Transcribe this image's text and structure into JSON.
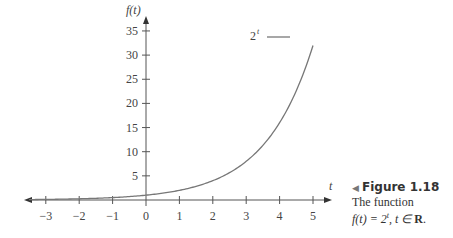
{
  "chart_data": {
    "type": "line",
    "title": "",
    "xlabel": "t",
    "ylabel": "f(t)",
    "xlim": [
      -3.5,
      5.7
    ],
    "ylim": [
      0,
      37
    ],
    "x_ticks": [
      -3,
      -2,
      -1,
      0,
      1,
      2,
      3,
      4,
      5
    ],
    "y_ticks": [
      5,
      10,
      15,
      20,
      25,
      30,
      35
    ],
    "grid": false,
    "legend_position": "top-center",
    "series": [
      {
        "name": "2^t",
        "x": [
          -3.5,
          -3,
          -2,
          -1,
          0,
          1,
          2,
          3,
          4,
          5
        ],
        "values": [
          0.088,
          0.125,
          0.25,
          0.5,
          1,
          2,
          4,
          8,
          16,
          32
        ]
      }
    ]
  },
  "axes": {
    "y_label": "f(t)",
    "x_label": "t",
    "x_tick_labels": [
      "−3",
      "−2",
      "−1",
      "0",
      "1",
      "2",
      "3",
      "4",
      "5"
    ],
    "y_tick_labels": [
      "5",
      "10",
      "15",
      "20",
      "25",
      "30",
      "35"
    ]
  },
  "legend": {
    "base": "2",
    "exponent": "t"
  },
  "caption": {
    "figure_number": "Figure 1.18",
    "line1": "The function",
    "line2": "f(t) = 2",
    "line2_exp": "t",
    "line2_rest": ", t ∈ ",
    "line2_set": "R",
    "line2_end": "."
  }
}
